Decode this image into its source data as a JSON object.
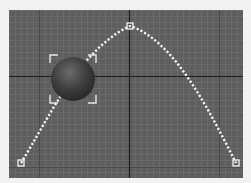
{
  "viewport": {
    "name": "perspective-viewport",
    "background": "#5e5e5e",
    "grid": {
      "minor_spacing": 6,
      "minor_color": "#6a6a6a",
      "major_color": "#4a4a4a",
      "axis_color": "#1e1e1e",
      "axis_x": 120,
      "axis_y": 66,
      "major_x": [
        30,
        210
      ],
      "major_y": [
        157
      ]
    },
    "spline": {
      "color": "#f4f4f4",
      "vertices": [
        {
          "x": 12,
          "y": 153
        },
        {
          "x": 121,
          "y": 16
        },
        {
          "x": 227,
          "y": 153
        }
      ],
      "path": "M12,153 C40,108 70,40 121,16 C165,30 200,100 227,153"
    },
    "sphere": {
      "cx": 64,
      "cy": 69,
      "r": 22,
      "highlight": "#6b6b6b",
      "shadow": "#262626",
      "selected": true
    },
    "selection_brackets": {
      "x": 41,
      "y": 45,
      "w": 46,
      "h": 48,
      "color": "#e8e8e8"
    }
  }
}
